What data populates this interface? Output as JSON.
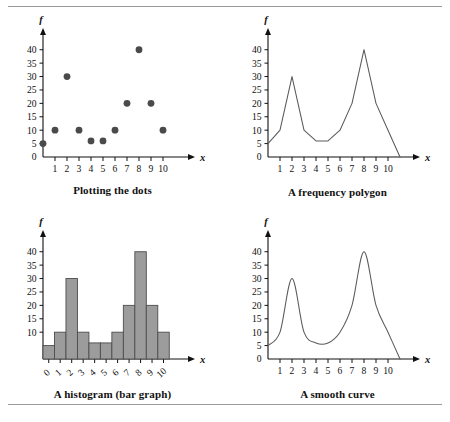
{
  "figure": {
    "panels": [
      {
        "id": "scatter",
        "caption": "Plotting the dots"
      },
      {
        "id": "polygon",
        "caption": "A frequency polygon"
      },
      {
        "id": "histogram",
        "caption": "A histogram (bar graph)"
      },
      {
        "id": "curve",
        "caption": "A smooth curve"
      }
    ],
    "colors": {
      "dot": "#4a4a4a",
      "line": "#5a5a5a",
      "bar_fill": "#9c9c9c",
      "bar_stroke": "#4d4d4d",
      "axis": "#111111",
      "rule": "#9a9a9a"
    }
  },
  "chart_data": [
    {
      "type": "scatter",
      "title": "Plotting the dots",
      "xlabel": "x",
      "ylabel": "f",
      "x": [
        0,
        1,
        2,
        3,
        4,
        5,
        6,
        7,
        8,
        9,
        10
      ],
      "values": [
        5,
        10,
        30,
        10,
        6,
        6,
        10,
        20,
        40,
        20,
        10
      ],
      "xticks": [
        1,
        2,
        3,
        4,
        5,
        6,
        7,
        8,
        9,
        10
      ],
      "xtick_labels": [
        "1",
        "2",
        "3",
        "4",
        "5",
        "6",
        "7",
        "8",
        "9",
        "10"
      ],
      "yticks": [
        0,
        5,
        10,
        15,
        20,
        25,
        30,
        35,
        40
      ],
      "ytick_labels": [
        "0",
        "5",
        "10",
        "15",
        "20",
        "25",
        "30",
        "35",
        "40"
      ],
      "xlim": [
        0,
        11
      ],
      "ylim": [
        0,
        44
      ],
      "grid": false,
      "legend": "none"
    },
    {
      "type": "line",
      "title": "A frequency polygon",
      "xlabel": "x",
      "ylabel": "f",
      "x": [
        0,
        1,
        2,
        3,
        4,
        5,
        6,
        7,
        8,
        9,
        10,
        11
      ],
      "values": [
        5,
        10,
        30,
        10,
        6,
        6,
        10,
        20,
        40,
        20,
        10,
        0
      ],
      "xticks": [
        1,
        2,
        3,
        4,
        5,
        6,
        7,
        8,
        9,
        10
      ],
      "xtick_labels": [
        "1",
        "2",
        "3",
        "4",
        "5",
        "6",
        "7",
        "8",
        "9",
        "10"
      ],
      "yticks": [
        0,
        5,
        10,
        15,
        20,
        25,
        30,
        35,
        40
      ],
      "ytick_labels": [
        "0",
        "5",
        "10",
        "15",
        "20",
        "25",
        "30",
        "35",
        "40"
      ],
      "xlim": [
        0,
        11
      ],
      "ylim": [
        0,
        44
      ],
      "grid": false,
      "legend": "none"
    },
    {
      "type": "bar",
      "title": "A histogram (bar graph)",
      "xlabel": "x",
      "ylabel": "f",
      "categories": [
        "0",
        "1",
        "2",
        "3",
        "4",
        "5",
        "6",
        "7",
        "8",
        "9",
        "10"
      ],
      "values": [
        5,
        10,
        30,
        10,
        6,
        6,
        10,
        20,
        40,
        20,
        10
      ],
      "xticks": [
        0,
        1,
        2,
        3,
        4,
        5,
        6,
        7,
        8,
        9,
        10
      ],
      "xtick_labels": [
        "0",
        "1",
        "2",
        "3",
        "4",
        "5",
        "6",
        "7",
        "8",
        "9",
        "10"
      ],
      "yticks": [
        10,
        15,
        20,
        25,
        30,
        35,
        40
      ],
      "ytick_labels": [
        "10",
        "15",
        "20",
        "25",
        "30",
        "35",
        "40"
      ],
      "xlim": [
        -0.5,
        11
      ],
      "ylim": [
        0,
        44
      ],
      "grid": false,
      "legend": "none"
    },
    {
      "type": "line",
      "title": "A smooth curve",
      "xlabel": "x",
      "ylabel": "f",
      "x": [
        0,
        1,
        2,
        3,
        4,
        5,
        6,
        7,
        8,
        9,
        10,
        11
      ],
      "values": [
        5,
        10,
        30,
        10,
        6,
        6,
        10,
        20,
        40,
        20,
        10,
        0
      ],
      "smoothed": true,
      "xticks": [
        1,
        2,
        3,
        4,
        5,
        6,
        7,
        8,
        9,
        10
      ],
      "xtick_labels": [
        "1",
        "2",
        "3",
        "4",
        "5",
        "6",
        "7",
        "8",
        "9",
        "10"
      ],
      "yticks": [
        0,
        5,
        10,
        15,
        20,
        25,
        30,
        35,
        40
      ],
      "ytick_labels": [
        "0",
        "5",
        "10",
        "15",
        "20",
        "25",
        "30",
        "35",
        "40"
      ],
      "xlim": [
        0,
        11
      ],
      "ylim": [
        0,
        44
      ],
      "grid": false,
      "legend": "none"
    }
  ]
}
